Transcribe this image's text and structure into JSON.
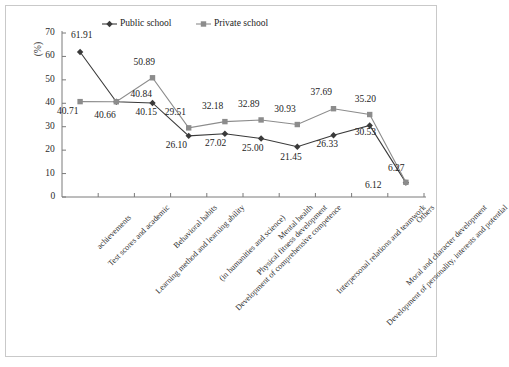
{
  "figure": {
    "border_color": "#c9c9c9",
    "background": "#ffffff"
  },
  "axes": {
    "y_label": "(%)",
    "y_ticks": [
      "0",
      "10",
      "20",
      "30",
      "40",
      "50",
      "60",
      "70"
    ],
    "y_min": 0,
    "y_max": 70,
    "axis_color": "#7a7a7a"
  },
  "legend": {
    "items": [
      {
        "label": "Public school",
        "color": "#3a3a3a",
        "marker": "diamond-marker"
      },
      {
        "label": "Private school",
        "color": "#8c8c8c",
        "marker": "square-marker"
      }
    ]
  },
  "chart_data": {
    "type": "line",
    "title": "",
    "xlabel": "",
    "ylabel": "(%)",
    "ylim": [
      0,
      70
    ],
    "grid": false,
    "legend_position": "top-center",
    "categories": [
      "Test scores and academic achievements",
      "Learning method and learning ability",
      "Behavioral habits",
      "Development of comprehensive competence (in humanities and science)",
      "Physical fitness development",
      "Mental health",
      "Interpersonal relations and teamwork",
      "Development of personality, interests and potential",
      "Moral and character development",
      "Others"
    ],
    "category_lines": [
      [
        "Test scores and academic",
        "achievements"
      ],
      [
        "Learning method and learning ability"
      ],
      [
        "Behavioral habits"
      ],
      [
        "Development of comprehensive competence",
        "(in humanities and science)"
      ],
      [
        "Physical fitness development"
      ],
      [
        "Mental health"
      ],
      [
        "Interpersonal relations and teamwork"
      ],
      [
        "Development of personality, interests and potential"
      ],
      [
        "Moral and character development"
      ],
      [
        "Others"
      ]
    ],
    "series": [
      {
        "name": "Public school",
        "color": "#3a3a3a",
        "marker": "diamond",
        "values": [
          61.91,
          40.66,
          40.15,
          26.1,
          27.02,
          25.0,
          21.45,
          26.33,
          30.53,
          6.12
        ],
        "labels": [
          "61.91",
          "40.66",
          "40.15",
          "26.10",
          "27.02",
          "25.00",
          "21.45",
          "26.33",
          "30.53",
          "6.12"
        ]
      },
      {
        "name": "Private school",
        "color": "#8c8c8c",
        "marker": "square",
        "values": [
          40.71,
          40.66,
          50.89,
          29.51,
          32.18,
          32.89,
          30.93,
          37.69,
          35.2,
          6.27
        ],
        "labels": [
          "40.71",
          "40.66",
          "50.89",
          "29.51",
          "32.18",
          "32.89",
          "30.93",
          "37.69",
          "35.20",
          "6.27"
        ]
      }
    ],
    "value_label_extra": {
      "public_first_private": "40.71",
      "private_third": "40.84"
    }
  }
}
